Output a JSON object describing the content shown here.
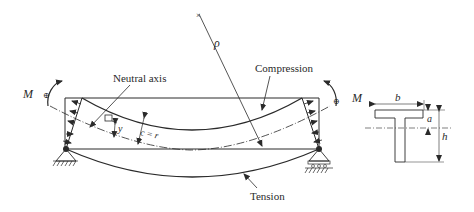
{
  "diagram": {
    "labels": {
      "neutral_axis": "Neutral axis",
      "compression": "Compression",
      "tension": "Tension",
      "rho": "ρ",
      "moment_left": "M",
      "moment_right": "M",
      "y": "y",
      "c_eq_r": "c = r"
    },
    "cross_section": {
      "shape": "T-section",
      "width_label": "b",
      "flange_label": "a",
      "height_label": "h"
    },
    "colors": {
      "stroke": "#2a2a2a",
      "background": "#ffffff"
    }
  }
}
